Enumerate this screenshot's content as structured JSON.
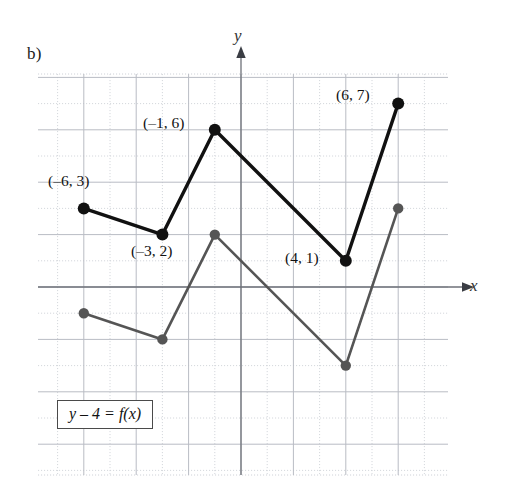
{
  "figure": {
    "part_label": "b)",
    "equation_box": "y – 4 = f(x)",
    "axis_labels": {
      "x": "x",
      "y": "y"
    },
    "colors": {
      "transformed_curve": "#111111",
      "original_curve": "#555555",
      "grid_major": "#b9bcc4",
      "grid_minor": "#cfd2d8",
      "axis": "#6e7179",
      "box_border": "#4a4a4a"
    },
    "point_labels": [
      {
        "text": "(–6, 3)",
        "x": 48,
        "y": 172
      },
      {
        "text": "(–1, 6)",
        "x": 143,
        "y": 114
      },
      {
        "text": "(–3, 2)",
        "x": 131,
        "y": 242
      },
      {
        "text": "(4, 1)",
        "x": 285,
        "y": 249
      },
      {
        "text": "(6, 7)",
        "x": 336,
        "y": 86
      }
    ]
  },
  "chart_data": {
    "type": "line",
    "title": "",
    "xlabel": "x",
    "ylabel": "y",
    "xlim": [
      -7.75,
      7.9
    ],
    "ylim": [
      -7.2,
      8.1
    ],
    "grid": true,
    "grid_major_step": 2,
    "grid_minor_step": 1,
    "legend": "none",
    "annotations": [
      "y – 4 = f(x)",
      "b)"
    ],
    "series": [
      {
        "name": "y - 4 = f(x)",
        "label": "transformed",
        "color": "#111111",
        "markers": true,
        "x": [
          -6,
          -3,
          -1,
          4,
          6
        ],
        "y": [
          3,
          2,
          6,
          1,
          7
        ],
        "labeled_points": [
          "(–6, 3)",
          "(–3, 2)",
          "(–1, 6)",
          "(4, 1)",
          "(6, 7)"
        ]
      },
      {
        "name": "y = f(x)",
        "label": "original",
        "color": "#555555",
        "markers": true,
        "x": [
          -6,
          -3,
          -1,
          4,
          6
        ],
        "y": [
          -1,
          -2,
          2,
          -3,
          3
        ],
        "labeled_points": []
      }
    ]
  }
}
